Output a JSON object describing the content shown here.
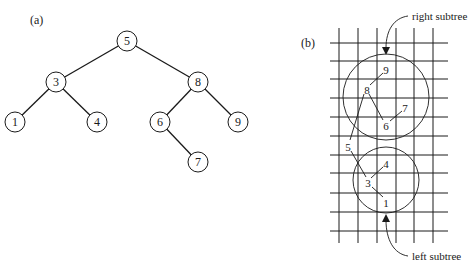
{
  "panel_a": {
    "label": "(a)",
    "nodes": [
      {
        "id": "5",
        "label": "5",
        "x": 127,
        "y": 41
      },
      {
        "id": "3",
        "label": "3",
        "x": 56,
        "y": 82
      },
      {
        "id": "8",
        "label": "8",
        "x": 198,
        "y": 82
      },
      {
        "id": "1",
        "label": "1",
        "x": 15,
        "y": 122
      },
      {
        "id": "4",
        "label": "4",
        "x": 97,
        "y": 122
      },
      {
        "id": "6",
        "label": "6",
        "x": 160,
        "y": 122
      },
      {
        "id": "9",
        "label": "9",
        "x": 238,
        "y": 122
      },
      {
        "id": "7",
        "label": "7",
        "x": 198,
        "y": 162
      }
    ],
    "edges": [
      [
        "5",
        "3"
      ],
      [
        "5",
        "8"
      ],
      [
        "3",
        "1"
      ],
      [
        "3",
        "4"
      ],
      [
        "8",
        "6"
      ],
      [
        "8",
        "9"
      ],
      [
        "6",
        "7"
      ]
    ]
  },
  "panel_b": {
    "label": "(b)",
    "right_subtree_label": "right subtree",
    "left_subtree_label": "left subtree",
    "points": [
      {
        "label": "9",
        "x": 386,
        "y": 70
      },
      {
        "label": "8",
        "x": 367,
        "y": 90
      },
      {
        "label": "7",
        "x": 405,
        "y": 108
      },
      {
        "label": "6",
        "x": 386,
        "y": 126
      },
      {
        "label": "5",
        "x": 348,
        "y": 147
      },
      {
        "label": "4",
        "x": 386,
        "y": 164
      },
      {
        "label": "3",
        "x": 368,
        "y": 183
      },
      {
        "label": "1",
        "x": 386,
        "y": 203
      }
    ]
  }
}
